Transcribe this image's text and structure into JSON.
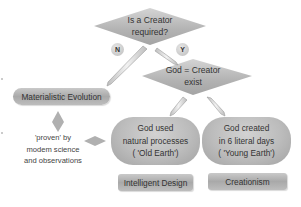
{
  "diagram": {
    "decisions": [
      {
        "id": "creator-required",
        "text_line1": "Is a Creator",
        "text_line2": "required?"
      },
      {
        "id": "god-exists",
        "text_line1": "God = Creator",
        "text_line2": "exist"
      }
    ],
    "branches": {
      "no_label": "N",
      "yes_label": "Y"
    },
    "materialistic": {
      "label": "Materialistic Evolution",
      "note_line1": "'proven' by",
      "note_line2": "modem science",
      "note_line3": "and observations"
    },
    "outcomes": [
      {
        "id": "old-earth",
        "line1": "God used",
        "line2": "natural processes",
        "line3": "( 'Old Earth')",
        "category": "Intelligent Design"
      },
      {
        "id": "young-earth",
        "line1": "God created",
        "line2": "in 6 literal days",
        "line3": "( 'Young Earth')",
        "category": "Creationism"
      }
    ],
    "colors": {
      "shape_fill": "#b5b5b5",
      "text": "#333333",
      "background": "#ffffff"
    }
  }
}
